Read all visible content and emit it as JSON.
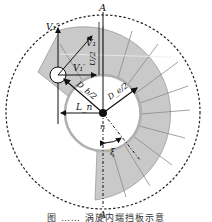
{
  "figure": {
    "labels": {
      "top_point": "A",
      "bottom_point": "A",
      "v1_double_prime": "V₁″",
      "v1_prime": "V₁′",
      "v1": "V₁",
      "u_half": "U/2",
      "db_half": "D_b/2",
      "de_half": "D_e/2",
      "ln": "L_n",
      "center": "n",
      "xi": "ξ"
    },
    "colors": {
      "ring_fill": "#c9c9c9",
      "blade_line": "#8a8a8a",
      "inner_circle": "#b0b0b0",
      "ink": "#111111"
    },
    "caption": "图 ……  涡旋内端挡板示意"
  }
}
